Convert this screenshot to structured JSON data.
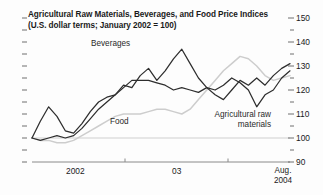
{
  "chart_data": {
    "type": "line",
    "title": "Agricultural Raw Materials, Beverages, and Food Price Indices",
    "subtitle": "(U.S. dollar terms; January 2002 = 100)",
    "xlabel": "",
    "ylabel": "",
    "ylim": [
      90,
      150
    ],
    "yticks_major": [
      150,
      140,
      130,
      120,
      110,
      100,
      90
    ],
    "yticks_minor": [
      145,
      135,
      125,
      115,
      105,
      95
    ],
    "ytick_labels": [
      "150",
      "140",
      "130",
      "120",
      "110",
      "100",
      "90"
    ],
    "grid": "baseline-100-only",
    "legend_position": "inline-annotations",
    "xtick_labels": [
      "2002",
      "03",
      "Aug.\n2004"
    ],
    "xaxis_end_label_line1": "Aug.",
    "xaxis_end_label_line2": "2004",
    "x_start": "Jan 2002",
    "x_end": "Aug 2004",
    "series": [
      {
        "name": "Beverages",
        "color": "#2e2e2e",
        "label": "Beverages",
        "x": [
          0,
          1,
          2,
          3,
          4,
          5,
          6,
          7,
          8,
          9,
          10,
          11,
          12,
          13,
          14,
          15,
          16,
          17,
          18,
          19,
          20,
          21,
          22,
          23,
          24,
          25,
          26,
          27,
          28,
          29,
          30,
          31
        ],
        "values": [
          100,
          107,
          113,
          109,
          103,
          102,
          106,
          111,
          115,
          117,
          118,
          122,
          121,
          126,
          129,
          124,
          128,
          133,
          137,
          131,
          125,
          121,
          118,
          116,
          120,
          124,
          122,
          125,
          122,
          126,
          129,
          131
        ]
      },
      {
        "name": "Agricultural raw materials",
        "color": "#2e2e2e",
        "label": "Agricultural raw materials",
        "x": [
          0,
          1,
          2,
          3,
          4,
          5,
          6,
          7,
          8,
          9,
          10,
          11,
          12,
          13,
          14,
          15,
          16,
          17,
          18,
          19,
          20,
          21,
          22,
          23,
          24,
          25,
          26,
          27,
          28,
          29,
          30,
          31
        ],
        "values": [
          100,
          99,
          100,
          101,
          100,
          101,
          104,
          108,
          112,
          115,
          118,
          121,
          124,
          124,
          124,
          123,
          122,
          120,
          121,
          120,
          119,
          121,
          120,
          122,
          125,
          123,
          120,
          113,
          118,
          120,
          125,
          128
        ]
      },
      {
        "name": "Food",
        "color": "#cdcdcd",
        "label": "Food",
        "x": [
          0,
          1,
          2,
          3,
          4,
          5,
          6,
          7,
          8,
          9,
          10,
          11,
          12,
          13,
          14,
          15,
          16,
          17,
          18,
          19,
          20,
          21,
          22,
          23,
          24,
          25,
          26,
          27,
          28,
          29,
          30,
          31
        ],
        "values": [
          100,
          99,
          99,
          98,
          98,
          99,
          101,
          103,
          105,
          107,
          109,
          110,
          110,
          110,
          111,
          112,
          112,
          111,
          110,
          112,
          116,
          120,
          124,
          128,
          131,
          134,
          133,
          130,
          126,
          124,
          125,
          126
        ]
      }
    ],
    "annotations": [
      {
        "text": "Beverages",
        "near_series": "Beverages"
      },
      {
        "text": "Food",
        "near_series": "Food"
      },
      {
        "text": "Agricultural raw",
        "near_series": "Agricultural raw materials"
      },
      {
        "text": "materials",
        "near_series": "Agricultural raw materials"
      }
    ],
    "colors": {
      "dark_line": "#2e2e2e",
      "light_line": "#cdcdcd",
      "axis": "#8a8a8a",
      "text": "#1a1a1a",
      "background": "#fdfdfd"
    }
  },
  "labels": {
    "beverages": "Beverages",
    "food": "Food",
    "agri_line1": "Agricultural raw",
    "agri_line2": "materials",
    "x_2002": "2002",
    "x_03": "03",
    "x_aug": "Aug.",
    "x_2004": "2004",
    "y_150": "150",
    "y_140": "140",
    "y_130": "130",
    "y_120": "120",
    "y_110": "110",
    "y_100": "100",
    "y_90": "90",
    "title_line1": "Agricultural Raw Materials, Beverages, and Food Price Indices",
    "title_line2": "(U.S. dollar terms; January 2002 = 100)"
  }
}
